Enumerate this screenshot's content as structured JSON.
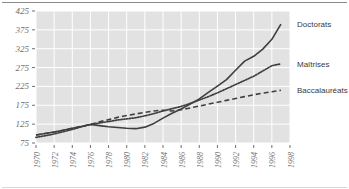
{
  "chart_data": {
    "type": "line",
    "title": "",
    "subtitle": "",
    "xlabel": "",
    "ylabel": "",
    "xlim": [
      1970,
      1998
    ],
    "ylim": [
      75,
      425
    ],
    "grid": true,
    "legend_position": "right-inline",
    "x_tick_labels": [
      "1970",
      "1972",
      "1974",
      "1976",
      "1978",
      "1980",
      "1982",
      "1984",
      "1986",
      "1988",
      "1990",
      "1992",
      "1994",
      "1996",
      "1998"
    ],
    "x_ticks": [
      1970,
      1972,
      1974,
      1976,
      1978,
      1980,
      1982,
      1984,
      1986,
      1988,
      1990,
      1992,
      1994,
      1996,
      1998
    ],
    "y_tick_labels": [
      "75",
      "125",
      "175",
      "225",
      "275",
      "325",
      "375",
      "425"
    ],
    "y_ticks": [
      75,
      125,
      175,
      225,
      275,
      325,
      375,
      425
    ],
    "x": [
      1970,
      1971,
      1972,
      1973,
      1974,
      1975,
      1976,
      1977,
      1978,
      1979,
      1980,
      1981,
      1982,
      1983,
      1984,
      1985,
      1986,
      1987,
      1988,
      1989,
      1990,
      1991,
      1992,
      1993,
      1994,
      1995,
      1996,
      1997
    ],
    "series": [
      {
        "name": "Doctorats",
        "style": "solid",
        "color": "#3f3f3f",
        "values": [
          96,
          100,
          104,
          109,
          114,
          119,
          124,
          121,
          118,
          116,
          114,
          113,
          117,
          127,
          141,
          154,
          165,
          178,
          192,
          209,
          226,
          243,
          268,
          292,
          305,
          324,
          350,
          390
        ]
      },
      {
        "name": "Maîtrises",
        "style": "dotted",
        "color": "#3f3f3f",
        "values": [
          90,
          94,
          99,
          105,
          111,
          118,
          124,
          128,
          132,
          136,
          139,
          142,
          147,
          153,
          160,
          166,
          172,
          180,
          189,
          198,
          208,
          219,
          230,
          241,
          252,
          266,
          280,
          285
        ]
      },
      {
        "name": "Baccalauréats",
        "style": "dashed",
        "color": "#3f3f3f",
        "values": [
          96,
          100,
          104,
          109,
          114,
          119,
          124,
          131,
          137,
          143,
          148,
          152,
          156,
          160,
          162,
          160,
          163,
          168,
          173,
          178,
          183,
          188,
          193,
          198,
          203,
          207,
          211,
          215
        ]
      }
    ]
  },
  "legend": {
    "items": [
      {
        "label": "Doctorats"
      },
      {
        "label": "Maîtrises"
      },
      {
        "label": "Baccalauréats"
      }
    ]
  },
  "colors": {
    "plot_background": "#e2e2e2",
    "gridline": "#ffffff",
    "line": "#3f3f3f",
    "axis_text": "#6f6f6f",
    "legend_text": "#3a3a3a",
    "rule": "#8a8a8a"
  }
}
